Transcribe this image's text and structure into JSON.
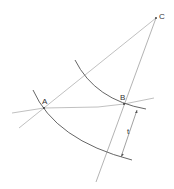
{
  "diagram": {
    "labels": {
      "A": "A",
      "B": "B",
      "C": "C",
      "t": "t"
    },
    "colors": {
      "light_line": "#a8a8a8",
      "dark_line": "#555555",
      "text": "#333333",
      "background": "#ffffff"
    },
    "points": {
      "A": [
        44,
        108
      ],
      "B": [
        124,
        104
      ],
      "C": [
        156,
        18
      ]
    }
  }
}
